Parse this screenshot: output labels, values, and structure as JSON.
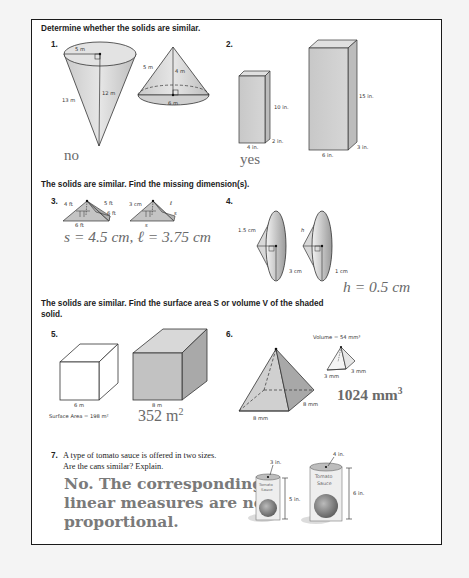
{
  "sections": [
    {
      "instruction": "Determine whether the solids are similar."
    },
    {
      "instruction": "The solids are similar. Find the missing dimension(s)."
    },
    {
      "instruction_line1": "The solids are similar. Find the surface area S or volume V of the shaded",
      "instruction_line2": "solid."
    }
  ],
  "problems": {
    "p1": {
      "number": "1.",
      "left_cone": {
        "radius": "5 m",
        "height": "12 m",
        "slant": "13 m"
      },
      "right_cone": {
        "slant": "5 m",
        "height": "4 m",
        "diameter": "6 m"
      },
      "answer": "no"
    },
    "p2": {
      "number": "2.",
      "small_prism": {
        "height": "10 in.",
        "depth": "2 in.",
        "width": "4 in."
      },
      "large_prism": {
        "height": "15 in.",
        "depth": "3 in.",
        "width": "6 in."
      },
      "answer": "yes"
    },
    "p3": {
      "number": "3.",
      "left_pyramid": {
        "height": "4 ft",
        "slant": "5 ft",
        "side": "6 ft",
        "base": "6 ft"
      },
      "right_pyramid": {
        "height": "3 cm",
        "slant": "ℓ",
        "side": "s",
        "base": "s"
      },
      "answer": "s = 4.5 cm, ℓ = 3.75 cm"
    },
    "p4": {
      "number": "4.",
      "left_cone": {
        "slant": "1.5 cm",
        "radius": "3 cm"
      },
      "right_cone": {
        "slant": "h",
        "radius": "1 cm"
      },
      "answer": "h = 0.5 cm"
    },
    "p5": {
      "number": "5.",
      "small_cube": {
        "edge": "6 m"
      },
      "large_cube": {
        "edge": "8 m"
      },
      "given": "Surface Area = 198 m²",
      "answer": "352 m",
      "answer_exp": "2"
    },
    "p6": {
      "number": "6.",
      "given": "Volume = 54 mm³",
      "small_pyramid": {
        "side1": "3 mm",
        "side2": "3 mm"
      },
      "large_pyramid": {
        "side1": "8 mm",
        "side2": "8 mm"
      },
      "answer": "1024 mm",
      "answer_exp": "3"
    },
    "p7": {
      "number": "7.",
      "question_line1": "A type of tomato sauce is offered in two sizes.",
      "question_line2": "Are the cans similar? Explain.",
      "small_can": {
        "diameter": "3 in.",
        "height": "5 in.",
        "label1": "Tomato",
        "label2": "Sauce"
      },
      "large_can": {
        "diameter": "4 in.",
        "height": "6 in.",
        "label1": "Tomato",
        "label2": "Sauce"
      },
      "answer_line1": "No. The corresponding",
      "answer_line2": "linear measures are not",
      "answer_line3": "proportional."
    }
  }
}
